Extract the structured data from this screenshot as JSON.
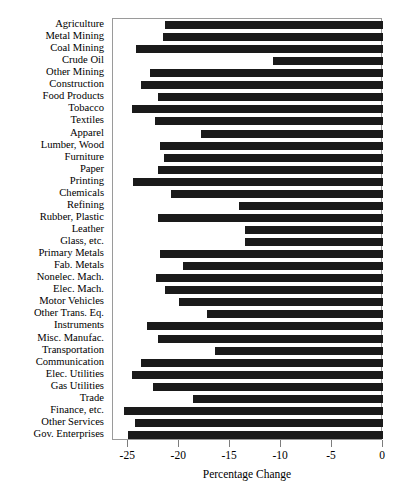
{
  "chart_data": {
    "type": "bar",
    "orientation": "horizontal",
    "title": "",
    "xlabel": "Percentage Change",
    "ylabel": "",
    "xlim": [
      -26.5,
      0
    ],
    "xticks": [
      -25,
      -20,
      -15,
      -10,
      -5,
      0
    ],
    "xtick_labels": [
      "-25",
      "-20",
      "-15",
      "-10",
      "-5",
      "0"
    ],
    "grid": false,
    "legend": false,
    "bar_color": "#1a1a1a",
    "frame_color": "#9a9a9a",
    "categories": [
      "Agriculture",
      "Metal Mining",
      "Coal Mining",
      "Crude Oil",
      "Other Mining",
      "Construction",
      "Food Products",
      "Tobacco",
      "Textiles",
      "Apparel",
      "Lumber, Wood",
      "Furniture",
      "Paper",
      "Printing",
      "Chemicals",
      "Refining",
      "Rubber, Plastic",
      "Leather",
      "Glass, etc.",
      "Primary Metals",
      "Fab. Metals",
      "Nonelec. Mach.",
      "Elec. Mach.",
      "Motor Vehicles",
      "Other Trans. Eq.",
      "Instruments",
      "Misc. Manufac.",
      "Transportation",
      "Communication",
      "Elec. Utilities",
      "Gas Utilities",
      "Trade",
      "Finance, etc.",
      "Other Services",
      "Gov. Enterprises"
    ],
    "values": [
      -21.4,
      -21.6,
      -24.2,
      -10.8,
      -22.9,
      -23.8,
      -22.1,
      -24.6,
      -22.4,
      -17.9,
      -21.9,
      -21.5,
      -22.1,
      -24.5,
      -20.8,
      -14.1,
      -22.1,
      -13.5,
      -13.5,
      -21.9,
      -19.6,
      -22.3,
      -21.4,
      -20.0,
      -17.3,
      -23.2,
      -22.1,
      -16.5,
      -23.8,
      -24.6,
      -22.6,
      -18.6,
      -25.4,
      -24.3,
      -25.0
    ],
    "units": "percent"
  },
  "axis": {
    "title": "Percentage Change"
  }
}
